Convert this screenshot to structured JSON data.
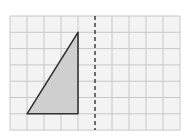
{
  "diagram": {
    "grid": {
      "left": 10,
      "top": 16,
      "cols": 10,
      "rows": 7,
      "cell_w": 17,
      "cell_h": 16.3,
      "line_color": "#c8c8c8",
      "fill_color": "#f3f3f3"
    },
    "mirror_line": {
      "grid_x": 5,
      "style": "dashed",
      "color": "#333333"
    },
    "triangle": {
      "vertices_grid": [
        [
          1,
          6
        ],
        [
          4,
          6
        ],
        [
          4,
          1
        ]
      ],
      "fill": "#cfcfcf",
      "stroke": "#333333"
    }
  }
}
